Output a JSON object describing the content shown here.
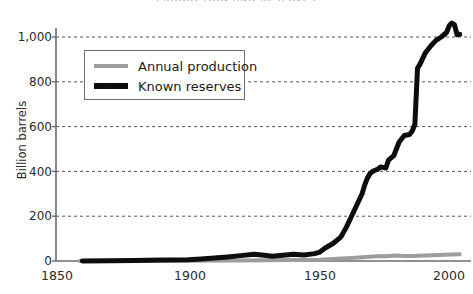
{
  "chart_data": {
    "type": "line",
    "title": "PRODUCTION AND RESERVES",
    "xlabel": "",
    "ylabel": "Billion barrels",
    "xlim": [
      1850,
      2005
    ],
    "ylim": [
      0,
      1100
    ],
    "grid": true,
    "legend_position": "upper-left",
    "xticks": [
      "1850",
      "1900",
      "1950",
      "2000"
    ],
    "xtick_values": [
      1850,
      1900,
      1950,
      2000
    ],
    "yticks": [
      "0",
      "200",
      "400",
      "600",
      "800",
      "1,000"
    ],
    "ytick_values": [
      0,
      200,
      400,
      600,
      800,
      1000
    ],
    "series": [
      {
        "name": "Annual production",
        "color": "#9d9d9d",
        "width": 4,
        "x": [
          1859,
          1880,
          1900,
          1920,
          1930,
          1940,
          1950,
          1955,
          1960,
          1965,
          1970,
          1973,
          1975,
          1979,
          1982,
          1985,
          1990,
          1995,
          2000,
          2003
        ],
        "y": [
          0,
          0,
          1,
          2,
          3,
          4,
          6,
          9,
          12,
          16,
          20,
          22,
          21,
          24,
          22,
          22,
          25,
          27,
          29,
          30
        ]
      },
      {
        "name": "Known reserves",
        "color": "#0d0d0d",
        "width": 5,
        "x": [
          1860,
          1880,
          1890,
          1900,
          1905,
          1910,
          1915,
          1920,
          1925,
          1928,
          1932,
          1936,
          1940,
          1944,
          1948,
          1950,
          1952,
          1955,
          1958,
          1960,
          1962,
          1964,
          1966,
          1967,
          1968,
          1969,
          1970,
          1971,
          1972,
          1973,
          1974,
          1975,
          1976,
          1978,
          1980,
          1982,
          1984,
          1985,
          1986,
          1987,
          1988,
          1990,
          1992,
          1994,
          1996,
          1998,
          1999,
          2000,
          2001,
          2002,
          2003
        ],
        "y": [
          0,
          2,
          4,
          6,
          9,
          13,
          18,
          24,
          30,
          27,
          21,
          26,
          30,
          27,
          33,
          40,
          58,
          78,
          108,
          150,
          200,
          250,
          300,
          340,
          370,
          390,
          400,
          405,
          410,
          420,
          418,
          415,
          450,
          470,
          530,
          560,
          565,
          580,
          610,
          860,
          880,
          930,
          960,
          985,
          1000,
          1020,
          1050,
          1062,
          1055,
          1010,
          1012
        ]
      }
    ]
  }
}
